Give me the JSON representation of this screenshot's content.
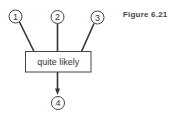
{
  "figure": {
    "caption": "Figure 6.21"
  },
  "diagram": {
    "inputs": [
      {
        "id": "node-1",
        "label": "1"
      },
      {
        "id": "node-2",
        "label": "2"
      },
      {
        "id": "node-3",
        "label": "3"
      }
    ],
    "combiner": {
      "label": "quite likely"
    },
    "output": {
      "id": "node-4",
      "label": "4"
    },
    "colors": {
      "stroke": "#333333",
      "fill": "#ffffff",
      "text": "#333333"
    }
  }
}
